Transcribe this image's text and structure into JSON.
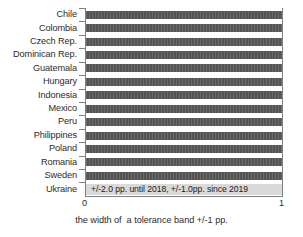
{
  "chart_data": {
    "type": "bar",
    "orientation": "horizontal",
    "title": "",
    "xlabel": "the width of  a tolerance band +/-1 pp.",
    "ylabel": "",
    "xlim": [
      0,
      1
    ],
    "xticks": [
      "0",
      "1"
    ],
    "grid": false,
    "legend": "none",
    "categories": [
      "Chile",
      "Colombia",
      "Czech Rep.",
      "Dominican Rep.",
      "Guatemala",
      "Hungary",
      "Indonesia",
      "Mexico",
      "Peru",
      "Philippines",
      "Poland",
      "Romania",
      "Sweden",
      "Ukraine"
    ],
    "values": [
      1,
      1,
      1,
      1,
      1,
      1,
      1,
      1,
      1,
      1,
      1,
      1,
      1,
      1
    ],
    "annotations": [
      {
        "category": "Ukraine",
        "text": "+/-2.0 pp. until 2018, +/-1.0pp. since 2019"
      }
    ],
    "colors": {
      "bar_default": "#595959",
      "bar_highlight": "#d9d9d9",
      "axis": "#808080",
      "text": "#2b2b2b"
    }
  },
  "axis": {
    "x_tick_low": "0",
    "x_tick_high": "1",
    "x_title": "the width of  a tolerance band +/-1 pp."
  }
}
